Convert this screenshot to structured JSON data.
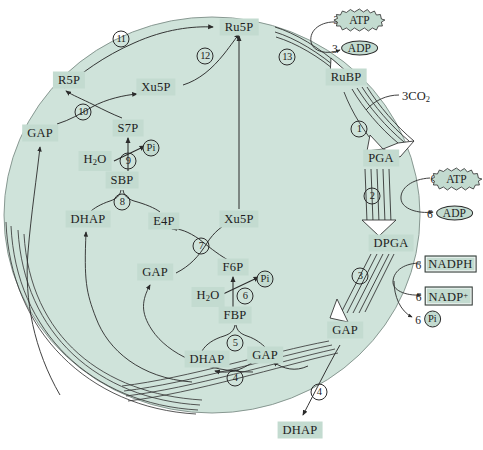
{
  "diagram": {
    "cycle_fill": "#cfe3da",
    "label_fill": "#c3dbd0",
    "stroke": "#2b2b2b"
  },
  "metabolites": [
    {
      "id": "ru5p_top",
      "text": "Ru5P",
      "x": 239,
      "y": 27,
      "style": "box"
    },
    {
      "id": "r5p",
      "text": "R5P",
      "x": 69,
      "y": 80,
      "style": "box"
    },
    {
      "id": "xu5p_mid",
      "text": "Xu5P",
      "x": 156,
      "y": 87,
      "style": "box"
    },
    {
      "id": "rubp",
      "text": "RuBP",
      "x": 346,
      "y": 77,
      "style": "box"
    },
    {
      "id": "gap_left",
      "text": "GAP",
      "x": 40,
      "y": 133,
      "style": "box"
    },
    {
      "id": "s7p",
      "text": "S7P",
      "x": 128,
      "y": 128,
      "style": "box"
    },
    {
      "id": "sbp",
      "text": "SBP",
      "x": 122,
      "y": 180,
      "style": "box"
    },
    {
      "id": "pga",
      "text": "PGA",
      "x": 381,
      "y": 158,
      "style": "box"
    },
    {
      "id": "dhap_left",
      "text": "DHAP",
      "x": 88,
      "y": 219,
      "style": "box"
    },
    {
      "id": "e4p",
      "text": "E4P",
      "x": 164,
      "y": 221,
      "style": "box"
    },
    {
      "id": "xu5p_low",
      "text": "Xu5P",
      "x": 239,
      "y": 219,
      "style": "box"
    },
    {
      "id": "dpga",
      "text": "DPGA",
      "x": 391,
      "y": 243,
      "style": "box"
    },
    {
      "id": "gap_mid",
      "text": "GAP",
      "x": 155,
      "y": 272,
      "style": "box"
    },
    {
      "id": "f6p",
      "text": "F6P",
      "x": 233,
      "y": 267,
      "style": "box"
    },
    {
      "id": "fbp",
      "text": "FBP",
      "x": 235,
      "y": 315,
      "style": "box"
    },
    {
      "id": "gap_right",
      "text": "GAP",
      "x": 345,
      "y": 330,
      "style": "box"
    },
    {
      "id": "dhap_mid",
      "text": "DHAP",
      "x": 207,
      "y": 359,
      "style": "box"
    },
    {
      "id": "gap_low",
      "text": "GAP",
      "x": 265,
      "y": 355,
      "style": "box"
    },
    {
      "id": "dhap_out",
      "text": "DHAP",
      "x": 300,
      "y": 430,
      "style": "box"
    }
  ],
  "water_labels": [
    {
      "id": "h2o_upper",
      "x": 95,
      "y": 161
    },
    {
      "id": "h2o_lower",
      "x": 208,
      "y": 297
    }
  ],
  "water_text": {
    "main": "H",
    "sub": "2",
    "tail": "O"
  },
  "co2_label": {
    "text": "3CO",
    "sub": "2",
    "x": 416,
    "y": 96
  },
  "steps": [
    {
      "n": "1",
      "x": 359,
      "y": 129
    },
    {
      "n": "2",
      "x": 372,
      "y": 196
    },
    {
      "n": "3",
      "x": 360,
      "y": 276
    },
    {
      "n": "4",
      "x": 235,
      "y": 378
    },
    {
      "n": "4",
      "x": 319,
      "y": 392
    },
    {
      "n": "5",
      "x": 235,
      "y": 343
    },
    {
      "n": "6",
      "x": 245,
      "y": 296
    },
    {
      "n": "7",
      "x": 201,
      "y": 246
    },
    {
      "n": "8",
      "x": 122,
      "y": 202
    },
    {
      "n": "9",
      "x": 128,
      "y": 161
    },
    {
      "n": "10",
      "x": 83,
      "y": 112
    },
    {
      "n": "11",
      "x": 121,
      "y": 39
    },
    {
      "n": "12",
      "x": 205,
      "y": 56
    },
    {
      "n": "13",
      "x": 287,
      "y": 57
    }
  ],
  "cofactors": [
    {
      "id": "atp3",
      "count": "3",
      "name": "ATP",
      "shape": "burst",
      "x": 355,
      "y": 20
    },
    {
      "id": "adp3",
      "count": "3",
      "name": "ADP",
      "shape": "oval",
      "x": 355,
      "y": 48
    },
    {
      "id": "atp6",
      "count": "6",
      "name": "ATP",
      "shape": "burst",
      "x": 452,
      "y": 179
    },
    {
      "id": "adp6",
      "count": "6",
      "name": "ADP",
      "shape": "oval",
      "x": 450,
      "y": 213
    },
    {
      "id": "nadph6",
      "count": "6",
      "name": "NADPH",
      "shape": "rect",
      "x": 446,
      "y": 264
    },
    {
      "id": "nadp6",
      "count": "6",
      "name": "NADP",
      "sup": "+",
      "shape": "rect",
      "x": 444,
      "y": 296
    },
    {
      "id": "pi6",
      "count": "6",
      "name": "Pi",
      "shape": "circle",
      "x": 428,
      "y": 319
    }
  ],
  "pi_markers": [
    {
      "id": "pi_upper",
      "x": 151,
      "y": 148
    },
    {
      "id": "pi_lower",
      "x": 265,
      "y": 279
    }
  ],
  "pi_text": "Pi"
}
